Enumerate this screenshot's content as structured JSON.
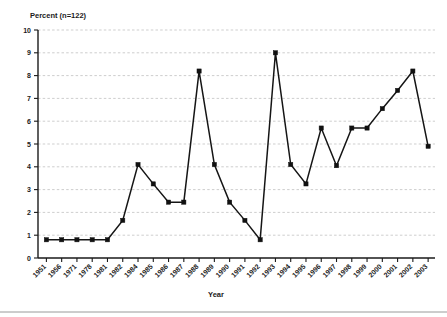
{
  "chart_data": {
    "type": "line",
    "title": "Percent (n=122)",
    "subtitle": "",
    "xlabel": "Year",
    "ylabel": "",
    "ylim": [
      0,
      10
    ],
    "ytick_labels": [
      "0",
      "1",
      "2",
      "3",
      "4",
      "5",
      "6",
      "7",
      "8",
      "9",
      "10"
    ],
    "yticks": [
      0,
      1,
      2,
      3,
      4,
      5,
      6,
      7,
      8,
      9,
      10
    ],
    "grid": "horizontal-dashed",
    "legend": "none",
    "marker": "square",
    "categories": [
      "1951",
      "1956",
      "1971",
      "1978",
      "1981",
      "1982",
      "1984",
      "1985",
      "1986",
      "1987",
      "1988",
      "1989",
      "1990",
      "1991",
      "1992",
      "1993",
      "1994",
      "1995",
      "1996",
      "1997",
      "1998",
      "1999",
      "2000",
      "2001",
      "2002",
      "2003"
    ],
    "values": [
      0.8,
      0.8,
      0.8,
      0.8,
      0.8,
      1.65,
      4.1,
      3.25,
      2.45,
      2.45,
      8.2,
      4.1,
      2.45,
      1.65,
      0.8,
      9.0,
      4.1,
      3.25,
      5.7,
      4.05,
      5.7,
      5.7,
      6.55,
      7.35,
      8.2,
      4.9
    ]
  },
  "colors": {
    "line": "#151515",
    "marker": "#111111",
    "grid": "#b9b9b9",
    "axis": "#1a1a1a",
    "background": "#ffffff"
  }
}
